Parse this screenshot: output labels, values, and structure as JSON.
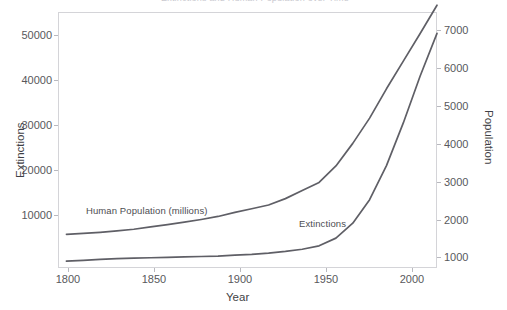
{
  "figure": {
    "title_sliver": "Extinctions and Human Population over Time",
    "background": "#ffffff",
    "frame_color": "#d4d4d8",
    "line_color": "#5f5f66"
  },
  "axes": {
    "x": {
      "label": "Year",
      "ticks": [
        "1800",
        "1850",
        "1900",
        "1950",
        "2000"
      ],
      "range": [
        1795,
        2020
      ]
    },
    "y_left": {
      "label": "Extinctions",
      "ticks": [
        "10000",
        "20000",
        "30000",
        "40000",
        "50000"
      ],
      "range": [
        0,
        60000
      ]
    },
    "y_right": {
      "label": "Population",
      "ticks": [
        "1000",
        "2000",
        "3000",
        "4000",
        "5000",
        "6000",
        "7000"
      ],
      "range": [
        0,
        7600
      ]
    }
  },
  "annotations": [
    {
      "text": "Human Population (millions)",
      "x": 86,
      "y": 210
    },
    {
      "text": "Extinctions",
      "x": 299,
      "y": 224
    }
  ],
  "chart_data": {
    "type": "line",
    "title": "Extinctions and Human Population over Time",
    "xlabel": "Year",
    "ylabel": "Extinctions",
    "ylabel_secondary": "Population",
    "xlim": [
      1795,
      2020
    ],
    "ylim": [
      0,
      60000
    ],
    "ylim_secondary": [
      0,
      7600
    ],
    "grid": false,
    "legend": "inline-annotations",
    "x": [
      1800,
      1810,
      1820,
      1830,
      1840,
      1850,
      1860,
      1870,
      1880,
      1890,
      1900,
      1910,
      1920,
      1930,
      1940,
      1950,
      1960,
      1970,
      1980,
      1990,
      2000,
      2010,
      2020
    ],
    "series": [
      {
        "name": "Human Population (millions)",
        "axis": "right",
        "units": "millions",
        "values": [
          1000,
          1030,
          1060,
          1100,
          1150,
          1220,
          1290,
          1360,
          1440,
          1530,
          1650,
          1760,
          1870,
          2060,
          2300,
          2540,
          3030,
          3700,
          4450,
          5320,
          6140,
          6960,
          7800
        ]
      },
      {
        "name": "Extinctions",
        "axis": "left",
        "units": "cumulative species",
        "values": [
          1600,
          1800,
          2000,
          2200,
          2300,
          2400,
          2500,
          2600,
          2700,
          2800,
          3000,
          3200,
          3500,
          3900,
          4400,
          5200,
          7000,
          10500,
          16000,
          24000,
          34000,
          45000,
          55000
        ]
      }
    ]
  }
}
